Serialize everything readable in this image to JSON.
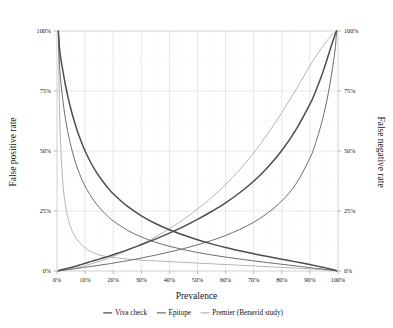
{
  "chart_data": {
    "type": "line",
    "title": "",
    "xlabel": "Prevalence",
    "ylabel": "False positive rate",
    "y2label": "False negative rate",
    "xlim": [
      0,
      100
    ],
    "ylim": [
      0,
      100
    ],
    "xticks": [
      "0%",
      "10%",
      "20%",
      "30%",
      "40%",
      "50%",
      "60%",
      "70%",
      "80%",
      "90%",
      "100%"
    ],
    "xtick_values": [
      0,
      10,
      20,
      30,
      40,
      50,
      60,
      70,
      80,
      90,
      100
    ],
    "yticks": [
      "0%",
      "25%",
      "50%",
      "75%",
      "100%"
    ],
    "ytick_values": [
      0,
      25,
      50,
      75,
      100
    ],
    "y2ticks": [
      "0%",
      "25%",
      "50%",
      "75%",
      "100%"
    ],
    "y2tick_values": [
      0,
      25,
      50,
      75,
      100
    ],
    "grid": true,
    "legend_position": "bottom",
    "x": [
      0.5,
      1,
      2,
      3,
      4,
      5,
      6,
      7,
      8,
      9,
      10,
      12,
      14,
      16,
      18,
      20,
      25,
      30,
      35,
      40,
      45,
      50,
      55,
      60,
      65,
      70,
      75,
      80,
      85,
      90,
      92,
      94,
      95,
      96,
      97,
      98,
      99,
      99.5
    ],
    "series": [
      {
        "name": "Viva check",
        "color": "#4d4d4d",
        "width": 1.5,
        "role": "false-positive-rate",
        "values": [
          100,
          91.5,
          84,
          77.5,
          72,
          67.2,
          63,
          59.2,
          55.8,
          52.8,
          50,
          45.2,
          41.2,
          37.8,
          34.8,
          32.2,
          27,
          23,
          19.8,
          17.2,
          15,
          13,
          11.3,
          9.8,
          8.4,
          7.2,
          6,
          4.9,
          3.8,
          2.7,
          2.2,
          1.7,
          1.5,
          1.2,
          0.9,
          0.6,
          0.3,
          0.1
        ]
      },
      {
        "name": "Viva check",
        "color": "#4d4d4d",
        "width": 1.5,
        "role": "false-negative-rate",
        "values": [
          0.1,
          0.3,
          0.6,
          0.9,
          1.2,
          1.5,
          1.8,
          2.1,
          2.5,
          2.8,
          3.2,
          3.9,
          4.6,
          5.3,
          6.0,
          6.8,
          8.8,
          11.0,
          13.3,
          15.8,
          18.5,
          21.5,
          24.8,
          28.4,
          32.6,
          37.4,
          43.2,
          50.2,
          58.8,
          69.5,
          74.8,
          80.8,
          84.2,
          87.8,
          91.5,
          95.2,
          98.5,
          100
        ]
      },
      {
        "name": "Epitope",
        "color": "#6e6e6e",
        "width": 1.0,
        "role": "false-positive-rate",
        "values": [
          100,
          84,
          72,
          63.5,
          57,
          51.8,
          47.5,
          43.8,
          40.6,
          37.8,
          35.4,
          31.3,
          28,
          25.2,
          22.9,
          20.9,
          17,
          14.2,
          12,
          10.3,
          8.9,
          7.7,
          6.7,
          5.8,
          5.0,
          4.2,
          3.5,
          2.8,
          2.1,
          1.4,
          1.1,
          0.9,
          0.7,
          0.6,
          0.45,
          0.3,
          0.15,
          0.05
        ]
      },
      {
        "name": "Epitope",
        "color": "#6e6e6e",
        "width": 1.0,
        "role": "false-negative-rate",
        "values": [
          0.05,
          0.15,
          0.3,
          0.45,
          0.6,
          0.75,
          0.9,
          1.05,
          1.2,
          1.4,
          1.55,
          1.9,
          2.2,
          2.6,
          2.9,
          3.3,
          4.3,
          5.4,
          6.6,
          7.9,
          9.3,
          10.9,
          12.7,
          14.8,
          17.3,
          20.3,
          24.2,
          29.2,
          36.2,
          47.0,
          53.2,
          61.0,
          65.6,
          70.8,
          77.0,
          84.2,
          92.5,
          100
        ]
      },
      {
        "name": "Premier (Benavid study)",
        "color": "#b5b5b5",
        "width": 1.0,
        "role": "false-positive-rate",
        "values": [
          100,
          62,
          38,
          27.5,
          21.5,
          17.8,
          15.2,
          13.3,
          11.8,
          10.6,
          9.6,
          8.1,
          7.1,
          6.4,
          5.9,
          5.6,
          5.0,
          4.5,
          4.2,
          3.9,
          3.6,
          3.3,
          3.0,
          2.7,
          2.4,
          2.1,
          1.8,
          1.5,
          1.2,
          0.9,
          0.75,
          0.6,
          0.5,
          0.4,
          0.3,
          0.2,
          0.1,
          0.05
        ]
      },
      {
        "name": "Premier (Benavid study)",
        "color": "#b5b5b5",
        "width": 1.0,
        "role": "false-negative-rate",
        "values": [
          0.05,
          0.1,
          0.25,
          0.4,
          0.6,
          0.8,
          1.0,
          1.3,
          1.6,
          1.9,
          2.2,
          2.9,
          3.6,
          4.4,
          5.2,
          6.1,
          8.5,
          11.2,
          14.2,
          17.6,
          21.5,
          25.8,
          30.6,
          36.0,
          42.2,
          49.2,
          57.2,
          66.0,
          75.5,
          85.5,
          89.2,
          92.6,
          94.2,
          95.8,
          97.3,
          98.6,
          99.6,
          100
        ]
      }
    ],
    "legend": [
      {
        "label": "Viva check",
        "color": "#4d4d4d"
      },
      {
        "label": "Epitope",
        "color": "#6e6e6e"
      },
      {
        "label": "Premier (Benavid study)",
        "color": "#b5b5b5"
      }
    ]
  }
}
